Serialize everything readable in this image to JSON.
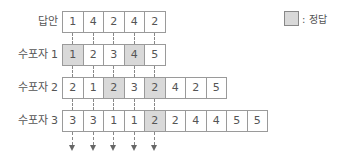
{
  "legend": {
    "label": ": 정답",
    "color": "#d9d9d9"
  },
  "rows": [
    {
      "label": "답안",
      "values": [
        1,
        4,
        2,
        4,
        2
      ],
      "correct": [
        false,
        false,
        false,
        false,
        false
      ]
    },
    {
      "label": "수포자 1",
      "values": [
        1,
        2,
        3,
        4,
        5
      ],
      "correct": [
        true,
        false,
        false,
        true,
        false
      ]
    },
    {
      "label": "수포자 2",
      "values": [
        2,
        1,
        2,
        3,
        2,
        4,
        2,
        5
      ],
      "correct": [
        false,
        false,
        true,
        false,
        true,
        false,
        false,
        false
      ]
    },
    {
      "label": "수포자 3",
      "values": [
        3,
        3,
        1,
        1,
        2,
        2,
        4,
        4,
        5,
        5
      ],
      "correct": [
        false,
        false,
        false,
        false,
        true,
        false,
        false,
        false,
        false,
        false
      ]
    }
  ],
  "arrow_count": 5
}
